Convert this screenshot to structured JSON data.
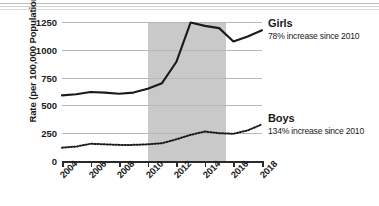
{
  "chart_data": {
    "type": "line",
    "title": "",
    "xlabel": "",
    "ylabel": "Rate (per 100,000 Population)",
    "x": [
      2004,
      2005,
      2006,
      2007,
      2008,
      2009,
      2010,
      2011,
      2012,
      2013,
      2014,
      2015,
      2016,
      2017,
      2018
    ],
    "xlim": [
      2004,
      2018
    ],
    "ylim": [
      0,
      1250
    ],
    "x_tick_labels": [
      "2004",
      "2006",
      "2008",
      "2010",
      "2012",
      "2014",
      "2016",
      "2018"
    ],
    "x_tick_values": [
      2004,
      2006,
      2008,
      2010,
      2012,
      2014,
      2016,
      2018
    ],
    "y_tick_labels": [
      "1250",
      "1000",
      "750",
      "500",
      "250",
      "0"
    ],
    "y_tick_values": [
      1250,
      1000,
      750,
      500,
      250,
      0
    ],
    "grid": "horizontal",
    "legend_position": "right-inline-annotations",
    "shaded_region": {
      "x_start": 2010,
      "x_end": 2015.5,
      "color": "#c9c9c9"
    },
    "series": [
      {
        "name": "Girls",
        "style": "solid",
        "color": "#1a1a1a",
        "values": [
          590,
          600,
          620,
          615,
          605,
          615,
          650,
          700,
          890,
          1245,
          1215,
          1195,
          1075,
          1120,
          1175
        ],
        "annotation_title": "Girls",
        "annotation_sub": "78% increase since 2010"
      },
      {
        "name": "Boys",
        "style": "dotted",
        "color": "#1a1a1a",
        "values": [
          120,
          130,
          155,
          150,
          145,
          145,
          150,
          160,
          195,
          235,
          265,
          250,
          245,
          275,
          330
        ],
        "annotation_title": "Boys",
        "annotation_sub": "134% increase since 2010"
      }
    ]
  },
  "axes": {
    "y_title": "Rate (per 100,000 Population)"
  }
}
